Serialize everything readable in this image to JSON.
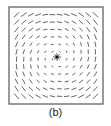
{
  "figure": {
    "caption": "(b)",
    "frame": {
      "x": 9,
      "y": 7,
      "width": 94,
      "height": 97,
      "stroke": "#555555"
    },
    "center": {
      "x": 57,
      "y": 57
    },
    "grid": {
      "rows": 12,
      "cols": 12
    },
    "swirl_angle_deg": 55,
    "dash_color": "#555555",
    "center_marker": "star"
  }
}
